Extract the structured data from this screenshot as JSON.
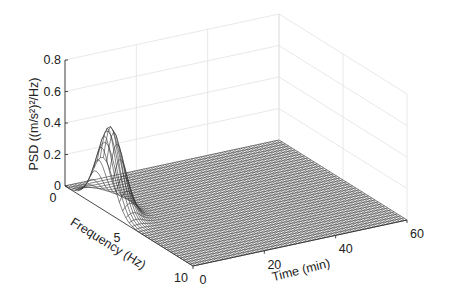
{
  "chart_data": {
    "type": "surface3d",
    "title": "",
    "xlabel": "Frequency (Hz)",
    "ylabel": "Time (min)",
    "zlabel": "PSD ((m/s²)²/Hz)",
    "xlim": [
      0,
      10
    ],
    "ylim": [
      0,
      60
    ],
    "zlim": [
      0,
      0.8
    ],
    "xticks": [
      "0",
      "5",
      "10"
    ],
    "yticks": [
      "0",
      "20",
      "40",
      "60"
    ],
    "zticks": [
      "0",
      "0.2",
      "0.4",
      "0.6",
      "0.8"
    ],
    "grid": true,
    "legend": null,
    "surface": {
      "description": "Mesh surface; single sharp peak near time≈2 min, frequency≈3 Hz, decaying rapidly to ~0 elsewhere",
      "peak": {
        "frequency_hz": 3,
        "time_min": 2,
        "psd": 0.52
      },
      "frequency_width_hz": 1.2,
      "time_decay_min": 3,
      "mesh_color": "#333333",
      "face_color": "#ffffff"
    }
  },
  "axes": {
    "z_label": "PSD ((m/s²)²/Hz)",
    "x_label": "Frequency (Hz)",
    "y_label": "Time (min)"
  }
}
